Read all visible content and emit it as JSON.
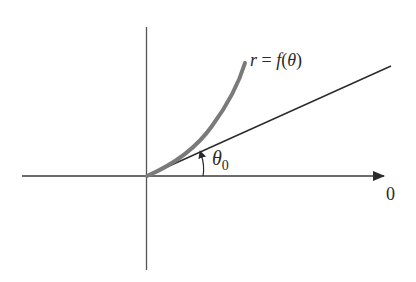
{
  "diagram": {
    "type": "polar-tangent-illustration",
    "curve_label": {
      "r": "r",
      "eq": " = ",
      "f": "f",
      "open": "(",
      "theta": "θ",
      "close": ")"
    },
    "angle_label": {
      "theta": "θ",
      "sub": "0"
    },
    "axis_label": "0",
    "colors": {
      "axes": "#3a3a3a",
      "ray": "#2a2a2a",
      "curve": "#7a7a7a",
      "text": "#2a2a2a"
    },
    "geometry": {
      "origin": [
        147,
        176
      ],
      "x_axis": [
        22,
        384
      ],
      "y_axis": [
        27,
        270
      ],
      "ray_end": [
        391,
        66
      ],
      "curve_end": [
        245,
        63
      ]
    }
  }
}
